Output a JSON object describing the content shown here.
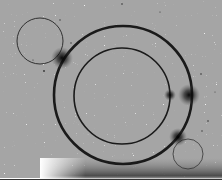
{
  "diagram": {
    "background": "#ffffff",
    "ring_color": "#1a1a1a",
    "outer_ring": {
      "cx": 123,
      "cy": 95,
      "r": 69,
      "stroke": 2.6
    },
    "inner_ring": {
      "cx": 122,
      "cy": 96,
      "r": 48,
      "stroke": 1.6
    },
    "probe_circles": [
      {
        "cx": 40,
        "cy": 41,
        "r": 23,
        "stroke": 0.9
      },
      {
        "cx": 188,
        "cy": 154,
        "r": 15,
        "stroke": 0.8
      }
    ],
    "blobs": [
      {
        "cx": 62,
        "cy": 58,
        "r": 11,
        "opacity": 0.85
      },
      {
        "cx": 189,
        "cy": 95,
        "r": 11,
        "opacity": 0.85
      },
      {
        "cx": 170,
        "cy": 95,
        "r": 6,
        "opacity": 0.8
      },
      {
        "cx": 178,
        "cy": 137,
        "r": 9,
        "opacity": 0.8
      }
    ],
    "shadow": {
      "x": 40,
      "y": 158,
      "width": 182,
      "height": 22
    },
    "baseline": {
      "y": 179,
      "color": "#333333"
    }
  }
}
